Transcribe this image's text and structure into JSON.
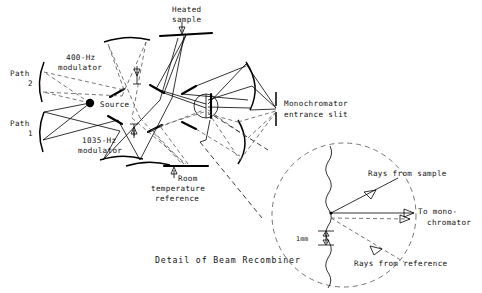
{
  "figure": {
    "caption": "Detail of Beam Recombiner",
    "labels": {
      "heated_sample_line1": "Heated",
      "heated_sample_line2": "sample",
      "modulator_400_line1": "400-Hz",
      "modulator_400_line2": "modulator",
      "modulator_1035_line1": "1035-Hz",
      "modulator_1035_line2": "modulator",
      "path2_line1": "Path",
      "path2_line2": "2",
      "path1_line1": "Path",
      "path1_line2": "1",
      "source": "Source",
      "monochromator_line1": "Monochromator",
      "monochromator_line2": "entrance slit",
      "room_ref_line1": "Room",
      "room_ref_line2": "temperature",
      "room_ref_line3": "reference"
    },
    "detail": {
      "dimension": "1mm",
      "rays_from_sample": "Rays from sample",
      "to_monochromator_line1": "To mono-",
      "to_monochromator_line2": "chromator",
      "rays_from_reference": "Rays from reference"
    },
    "colors": {
      "ink": "#000000",
      "dashed_ink": "#555555",
      "background": "#ffffff"
    }
  }
}
